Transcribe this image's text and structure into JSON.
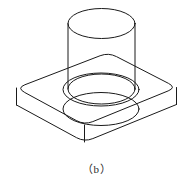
{
  "figure": {
    "caption": "（b）",
    "label_letter": "b",
    "type": "isometric-wireframe-technical-drawing",
    "background_color": "#ffffff",
    "line_color": "#1a1a1a",
    "line_width_px": 1,
    "canvas": {
      "width": 193,
      "height": 189
    },
    "parts": [
      {
        "name": "base-slab",
        "description": "rectangular plate with four rounded corners, drawn in isometric projection",
        "visible_edges": "top face outline, bottom face outline, three vertical corner edges"
      },
      {
        "name": "upper-cylinder",
        "description": "vertical circular cylinder rising from the slab, top face ellipse visible",
        "visible_edges": "top ellipse, two silhouette lines, bottom ellipse partially hidden"
      },
      {
        "name": "counterbore-hole",
        "description": "larger concentric circular recess below the cylinder, two ellipses",
        "visible_edges": "counterbore top ellipse, counterbore bottom ellipse"
      }
    ],
    "geometry": {
      "slab": {
        "top_face_corners": [
          [
            16.5,
            88.0
          ],
          [
            108.5,
            52.5
          ],
          [
            176.5,
            87.5
          ],
          [
            84.5,
            125.0
          ]
        ],
        "bottom_face_corners": [
          [
            16.5,
            105.0
          ],
          [
            108.5,
            69.5
          ],
          [
            176.5,
            104.5
          ],
          [
            84.5,
            142.0
          ]
        ],
        "corner_radius": 9,
        "thickness_px": 17
      },
      "cylinder": {
        "center_x": 101.5,
        "top_ellipse_cy": 23.5,
        "top_rx": 33.5,
        "top_ry": 15.0,
        "bottom_ellipse_cy": 89.0,
        "left_silhouette_x": 68.0,
        "right_silhouette_x": 135.0
      },
      "counterbore": {
        "center_x": 101.0,
        "upper_ellipse_cy": 89.5,
        "upper_rx": 38.0,
        "upper_ry": 16.5,
        "lower_ellipse_cy": 109.0,
        "lower_rx": 38.0,
        "lower_ry": 16.5
      }
    }
  }
}
